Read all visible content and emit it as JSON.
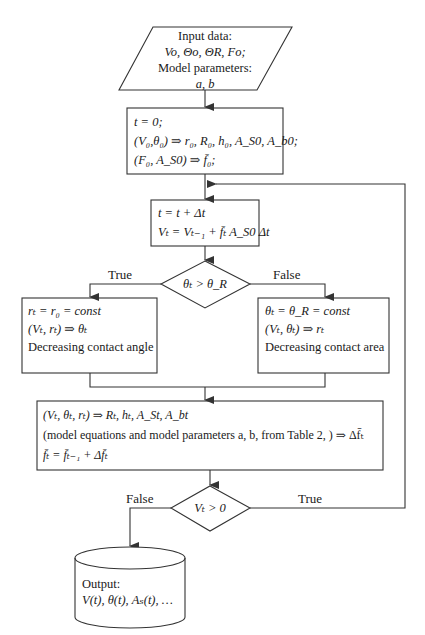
{
  "diagram": {
    "type": "flowchart",
    "input": {
      "title": "Input data:",
      "vars": "Vo, Θo, ΘR, Fo;",
      "params_label": "Model parameters:",
      "params": "a, b"
    },
    "init": {
      "line1": "t = 0;",
      "line2": "(V₀,θ₀) ⇒ r₀, R₀, h₀, A_S0, A_b0;",
      "line3": "(F₀, A_S0) ⇒ f̄₀;"
    },
    "step": {
      "line1": "t = t + Δt",
      "line2": "Vₜ = Vₜ₋₁ + f̄ₜ A_S0 Δt"
    },
    "decision1": {
      "condition": "θₜ > θ_R",
      "true_label": "True",
      "false_label": "False"
    },
    "branch_true": {
      "line1": "rₜ = r₀ = const",
      "line2": "(Vₜ, rₜ) ⇒ θₜ",
      "line3": "Decreasing contact angle"
    },
    "branch_false": {
      "line1": "θₜ = θ_R = const",
      "line2": "(Vₜ, θₜ) ⇒ rₜ",
      "line3": "Decreasing contact area"
    },
    "update": {
      "line1": "(Vₜ, θₜ, rₜ) ⇒ Rₜ, hₜ, A_St, A_bt",
      "line2": "(model equations and model parameters a, b, from Table 2, ) ⇒ Δf̄ₜ",
      "line3": "f̄ₜ = f̄ₜ₋₁ + Δf̄ₜ"
    },
    "decision2": {
      "condition": "Vₜ > 0",
      "false_label": "False",
      "true_label": "True"
    },
    "output": {
      "title": "Output:",
      "values": "V(t), θ(t), Aₛ(t), …"
    }
  },
  "colors": {
    "stroke": "#333333",
    "text": "#1a1a1a",
    "background": "#ffffff"
  }
}
